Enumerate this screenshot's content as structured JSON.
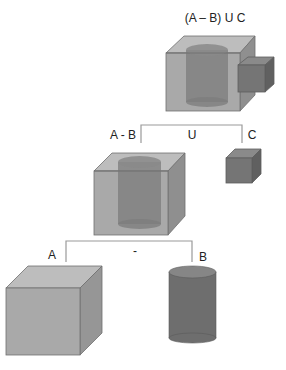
{
  "diagram": {
    "nodes": {
      "root": {
        "label": "(A – B) U C",
        "shape": "box-with-cylinder-hole-union-small-box"
      },
      "a_minus_b": {
        "label": "A - B",
        "shape": "box-with-cylinder-hole"
      },
      "c": {
        "label": "C",
        "shape": "small-box"
      },
      "a": {
        "label": "A",
        "shape": "box"
      },
      "b": {
        "label": "B",
        "shape": "cylinder"
      }
    },
    "operators": {
      "union": "U",
      "difference": "-"
    },
    "colors": {
      "box_front": "#a9a9a9",
      "box_top": "#bdbdbd",
      "box_side": "#8f8f8f",
      "cylinder_body": "#6e6e6e",
      "cylinder_top": "#868686",
      "small_box_front": "#757575",
      "line": "#9a9a9a",
      "edge": "#6a6a6a"
    }
  }
}
